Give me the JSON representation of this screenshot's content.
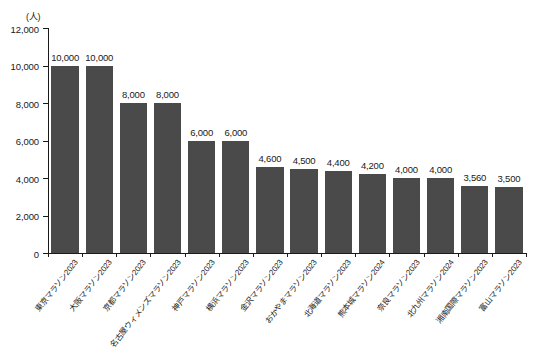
{
  "chart_data": {
    "type": "bar",
    "title": "",
    "subtitle": "",
    "xlabel": "",
    "ylabel": "",
    "unit_label": "(人)",
    "ylim": [
      0,
      12000
    ],
    "yticks": [
      0,
      2000,
      4000,
      6000,
      8000,
      10000,
      12000
    ],
    "ytick_labels": [
      "0",
      "2,000",
      "4,000",
      "6,000",
      "8,000",
      "10,000",
      "12,000"
    ],
    "grid": false,
    "legend": null,
    "bar_color": "#4a4a4a",
    "axis_color": "#1a1a1a",
    "categories": [
      "東京マラソン2023",
      "大阪マラソン2023",
      "京都マラソン2023",
      "名古屋ウィメンズマラソン2023",
      "神戸マラソン2023",
      "横浜マラソン2023",
      "金沢マラソン2023",
      "おかやまマラソン2023",
      "北海道マラソン2023",
      "熊本城マラソン2024",
      "奈良マラソン2023",
      "北九州マラソン2024",
      "湘南国際マラソン2023",
      "富山マラソン2023"
    ],
    "values": [
      10000,
      10000,
      8000,
      8000,
      6000,
      6000,
      4600,
      4500,
      4400,
      4200,
      4000,
      4000,
      3560,
      3500
    ],
    "value_labels": [
      "10,000",
      "10,000",
      "8,000",
      "8,000",
      "6,000",
      "6,000",
      "4,600",
      "4,500",
      "4,400",
      "4,200",
      "4,000",
      "4,000",
      "3,560",
      "3,500"
    ]
  }
}
